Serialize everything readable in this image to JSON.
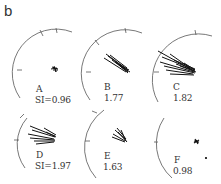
{
  "figure": {
    "panel_label": "b",
    "plots": [
      {
        "id": "A",
        "name_label": "A",
        "si_label": "SI=0.96",
        "si_value": 0.96
      },
      {
        "id": "B",
        "name_label": "B",
        "si_label": "1.77",
        "si_value": 1.77
      },
      {
        "id": "C",
        "name_label": "C",
        "si_label": "1.82",
        "si_value": 1.82
      },
      {
        "id": "D",
        "name_label": "D",
        "si_label": "SI=1.97",
        "si_value": 1.97
      },
      {
        "id": "E",
        "name_label": "E",
        "si_label": "1.63",
        "si_value": 1.63
      },
      {
        "id": "F",
        "name_label": "F",
        "si_label": "0.98",
        "si_value": 0.98
      }
    ],
    "colors": {
      "ink": "#222222",
      "axis": "#555555",
      "background": "#ffffff"
    }
  }
}
